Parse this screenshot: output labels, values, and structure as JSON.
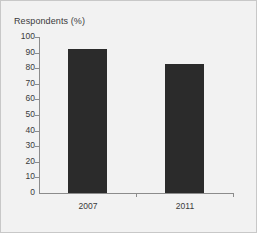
{
  "chart_data": {
    "type": "bar",
    "title": "Respondents (%)",
    "xlabel": "",
    "ylabel": "Respondents (%)",
    "categories": [
      "2007",
      "2011"
    ],
    "values": [
      92,
      83
    ],
    "ylim": [
      0,
      100
    ],
    "ytick_values": [
      0,
      10,
      20,
      30,
      40,
      50,
      60,
      70,
      80,
      90,
      100
    ],
    "ytick_labels": [
      "0",
      "10",
      "20",
      "30",
      "40",
      "50",
      "60",
      "70",
      "80",
      "90",
      "100"
    ],
    "grid": false,
    "legend": "none",
    "bar_color": "#2b2b2b",
    "axis_color": "#8c8c8c",
    "text_color": "#3a3a3a",
    "background_color": "#f2f2f2",
    "border_color": "#c8c8c8"
  }
}
